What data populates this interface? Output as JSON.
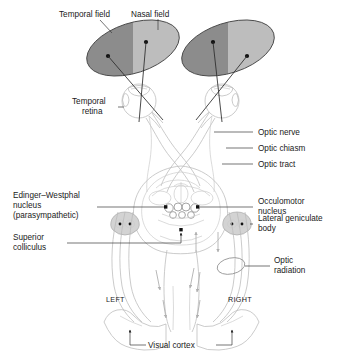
{
  "figure": {
    "labels": {
      "temporal_field": "Temporal field",
      "nasal_field": "Nasal field",
      "temporal_retina_line1": "Temporal",
      "temporal_retina_line2": "retina",
      "optic_nerve": "Optic nerve",
      "optic_chiasm": "Optic chiasm",
      "optic_tract": "Optic tract",
      "edinger_line1": "Edinger–Westphal",
      "edinger_line2": "nucleus",
      "edinger_line3": "(parasympathetic)",
      "occulomotor_line1": "Occulomotor",
      "occulomotor_line2": "nucleus",
      "superior_colliculus_line1": "Superior",
      "superior_colliculus_line2": "colliculus",
      "lateral_geniculate_line1": "Lateral geniculate",
      "lateral_geniculate_line2": "body",
      "optic_radiation_line1": "Optic",
      "optic_radiation_line2": "radiation",
      "left": "LEFT",
      "right": "RIGHT",
      "visual_cortex": "Visual cortex"
    },
    "colors": {
      "field_dark": "#8c8c8c",
      "field_light": "#bdbdbd",
      "field_stroke": "#4a4a4a",
      "structure_outline": "#b9b9b9",
      "nucleus_fill": "#d3d3d3",
      "ray_stroke": "#2b2b2b",
      "leader_stroke": "#3a3a3a",
      "text": "#1a1a1a",
      "background": "#ffffff"
    }
  }
}
